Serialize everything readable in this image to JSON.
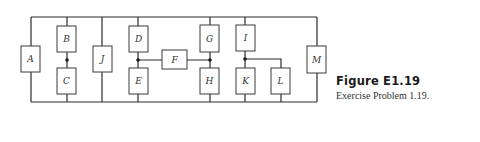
{
  "figure": {
    "title": "Figure E1.19",
    "caption": "Exercise Problem 1.19."
  },
  "elements": {
    "A": "A",
    "B": "B",
    "C": "C",
    "D": "D",
    "E": "E",
    "F": "F",
    "G": "G",
    "H": "H",
    "I": "I",
    "J": "J",
    "K": "K",
    "L": "L",
    "M": "M"
  },
  "colors": {
    "wire": "#2a2a2a",
    "box_stroke": "#3a3a3a",
    "text": "#333333"
  }
}
